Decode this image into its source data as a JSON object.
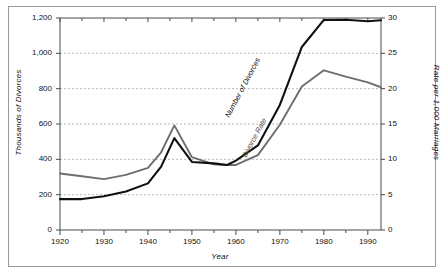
{
  "chart_data": {
    "type": "line",
    "title": "",
    "xlabel": "Year",
    "ylabel": "Thousands of Divorces",
    "y2label": "Rate per 1,000 Marriages",
    "xlim": [
      1920,
      1993
    ],
    "ylim": [
      0,
      1200
    ],
    "y2lim": [
      0,
      30
    ],
    "grid": true,
    "legend": "inline-labels",
    "x_ticks": [
      1920,
      1930,
      1940,
      1950,
      1960,
      1970,
      1980,
      1990
    ],
    "x_minor_ticks": [
      1925,
      1935,
      1945,
      1955,
      1965,
      1975,
      1985
    ],
    "y_ticks": [
      0,
      200,
      400,
      600,
      800,
      1000,
      1200
    ],
    "y_tick_labels": [
      "0",
      "200",
      "400",
      "600",
      "800",
      "1,000",
      "1,200"
    ],
    "y2_ticks": [
      0,
      5,
      10,
      15,
      20,
      25,
      30
    ],
    "y2_tick_labels": [
      "0",
      "5",
      "10",
      "15",
      "20",
      "25",
      "30"
    ],
    "series": [
      {
        "name": "Number of Divorces",
        "color": "#111111",
        "axis": "left",
        "units": "thousands",
        "x": [
          1920,
          1925,
          1930,
          1935,
          1940,
          1943,
          1946,
          1950,
          1955,
          1958,
          1960,
          1965,
          1970,
          1975,
          1980,
          1985,
          1990,
          1993
        ],
        "values": [
          175,
          175,
          191,
          218,
          264,
          359,
          520,
          385,
          377,
          368,
          393,
          479,
          708,
          1036,
          1189,
          1190,
          1182,
          1187
        ]
      },
      {
        "name": "Divorce Rate",
        "color": "#6e6e6e",
        "axis": "right",
        "units": "per 1,000 marriages",
        "x": [
          1920,
          1925,
          1930,
          1935,
          1940,
          1943,
          1946,
          1950,
          1955,
          1958,
          1960,
          1965,
          1970,
          1975,
          1980,
          1985,
          1990,
          1993
        ],
        "values": [
          8.0,
          7.6,
          7.2,
          7.8,
          8.8,
          11.0,
          14.8,
          10.3,
          9.3,
          9.2,
          9.2,
          10.6,
          14.9,
          20.3,
          22.6,
          21.7,
          20.9,
          20.2
        ]
      }
    ],
    "annotations": [
      {
        "text": "Number of Divorces",
        "series": "Number of Divorces"
      },
      {
        "text": "Divorce Rate",
        "series": "Divorce Rate"
      }
    ]
  }
}
